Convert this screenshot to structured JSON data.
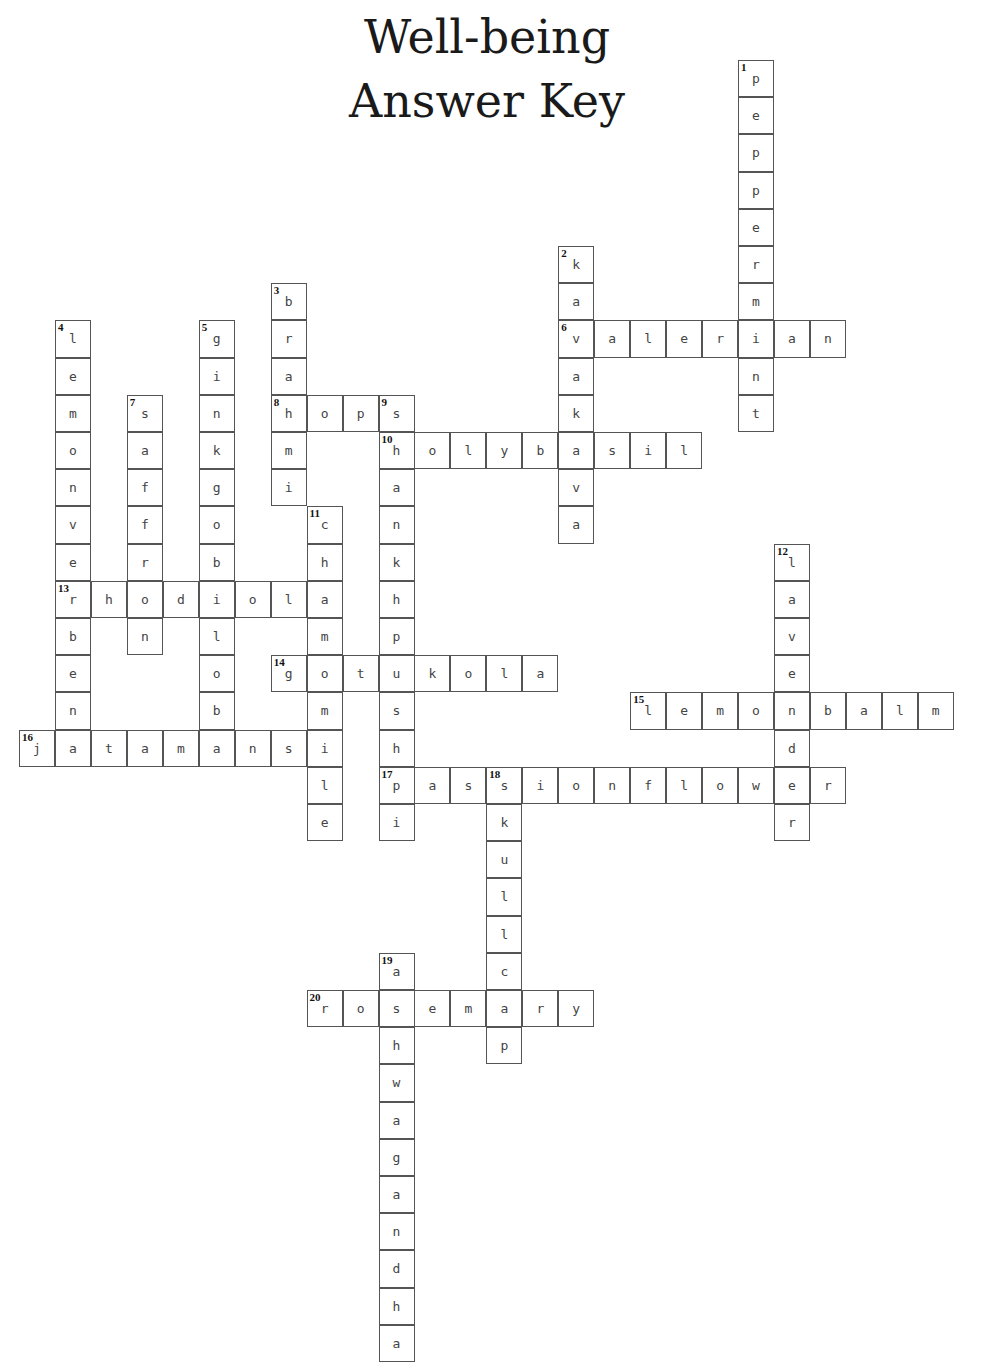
{
  "header": {
    "title_line1": "Well-being",
    "title_line2": "Answer Key"
  },
  "layout": {
    "origin_x": 19,
    "origin_y": 60,
    "cell_w": 35.95,
    "cell_h": 37.2
  },
  "words": [
    {
      "num": 1,
      "dir": "down",
      "row": 0,
      "col": 20,
      "answer": "peppermint"
    },
    {
      "num": 2,
      "dir": "down",
      "row": 5,
      "col": 15,
      "answer": "kavakava"
    },
    {
      "num": 3,
      "dir": "down",
      "row": 6,
      "col": 7,
      "answer": "brahmi"
    },
    {
      "num": 4,
      "dir": "down",
      "row": 7,
      "col": 1,
      "answer": "lemonverbena"
    },
    {
      "num": 5,
      "dir": "down",
      "row": 7,
      "col": 5,
      "answer": "ginkgobiloba"
    },
    {
      "num": 6,
      "dir": "across",
      "row": 7,
      "col": 15,
      "answer": "valerian"
    },
    {
      "num": 7,
      "dir": "down",
      "row": 9,
      "col": 3,
      "answer": "saffron"
    },
    {
      "num": 8,
      "dir": "across",
      "row": 9,
      "col": 7,
      "answer": "hops"
    },
    {
      "num": 9,
      "dir": "down",
      "row": 9,
      "col": 10,
      "answer": "shankhpushpi"
    },
    {
      "num": 10,
      "dir": "across",
      "row": 10,
      "col": 10,
      "answer": "holybasil"
    },
    {
      "num": 11,
      "dir": "down",
      "row": 12,
      "col": 8,
      "answer": "chamomile"
    },
    {
      "num": 12,
      "dir": "down",
      "row": 13,
      "col": 21,
      "answer": "lavender"
    },
    {
      "num": 13,
      "dir": "across",
      "row": 14,
      "col": 1,
      "answer": "rhodiola"
    },
    {
      "num": 14,
      "dir": "across",
      "row": 16,
      "col": 7,
      "answer": "gotukola"
    },
    {
      "num": 15,
      "dir": "across",
      "row": 17,
      "col": 17,
      "answer": "lemonbalm"
    },
    {
      "num": 16,
      "dir": "across",
      "row": 18,
      "col": 0,
      "answer": "jatamansi"
    },
    {
      "num": 17,
      "dir": "across",
      "row": 19,
      "col": 10,
      "answer": "passionflower"
    },
    {
      "num": 18,
      "dir": "down",
      "row": 19,
      "col": 13,
      "answer": "skullcap"
    },
    {
      "num": 19,
      "dir": "down",
      "row": 24,
      "col": 10,
      "answer": "ashwagandha"
    },
    {
      "num": 20,
      "dir": "across",
      "row": 25,
      "col": 8,
      "answer": "rosemary"
    }
  ]
}
